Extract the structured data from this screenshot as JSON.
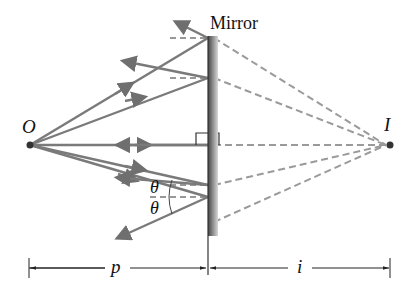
{
  "diagram": {
    "labels": {
      "mirror": "Mirror",
      "object": "O",
      "image": "I",
      "object_distance": "p",
      "image_distance": "i",
      "angle_incident": "θ",
      "angle_reflected": "θ"
    },
    "colors": {
      "ray": "#7a7a7a",
      "virtual_ray": "#9a9a9a",
      "mirror_dark": "#555555",
      "mirror_light": "#cfcfcf",
      "text": "#111111"
    },
    "geometry": {
      "object_point": [
        30,
        145
      ],
      "image_point": [
        390,
        145
      ],
      "mirror_x": 208,
      "mirror_top": 38,
      "mirror_bottom": 235,
      "reflection_points_y": [
        38,
        78,
        145,
        185,
        222
      ],
      "dimension_line_y": 268
    }
  }
}
